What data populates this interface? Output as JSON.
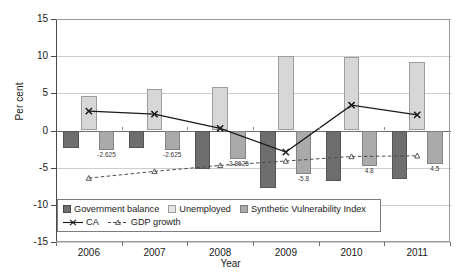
{
  "chart_data": {
    "type": "bar",
    "title": "",
    "xlabel": "Year",
    "ylabel": "Per cent",
    "categories": [
      "2006",
      "2007",
      "2008",
      "2009",
      "2010",
      "2011"
    ],
    "ylim": [
      -15,
      15
    ],
    "yticks": [
      15,
      10,
      5,
      0,
      -5,
      -10,
      -15
    ],
    "grid": true,
    "legend_position": "bottom-left-inside",
    "series": [
      {
        "name": "Government balance",
        "type": "bar",
        "color": "#6e6e6e",
        "values": [
          -2.3,
          -2.4,
          -5.2,
          -7.8,
          -6.8,
          -6.5
        ]
      },
      {
        "name": "Unemployed",
        "type": "bar",
        "color": "#d7d7d7",
        "values": [
          4.6,
          5.6,
          5.9,
          10.0,
          9.9,
          9.2
        ]
      },
      {
        "name": "Synthetic Vulnerability Index",
        "type": "bar",
        "color": "#aaaaaa",
        "values": [
          -2.625,
          -2.625,
          -3.8625,
          -5.8,
          -4.8,
          -4.5
        ],
        "data_labels": [
          "-2.625",
          "-2.625",
          "-3.8625",
          "-5.8",
          "4.8",
          "4.5"
        ]
      },
      {
        "name": "CA",
        "type": "line",
        "marker": "x",
        "style": "solid",
        "color": "#1a1a1a",
        "values": [
          2.6,
          2.2,
          0.3,
          -2.9,
          3.4,
          2.1
        ]
      },
      {
        "name": "GDP growth",
        "type": "line",
        "marker": "triangle",
        "style": "dashed",
        "color": "#4a4a4a",
        "values": [
          -6.4,
          -5.5,
          -4.7,
          -4.1,
          -3.5,
          -3.4
        ]
      }
    ]
  },
  "axes": {
    "y_title": "Per cent",
    "x_title": "Year",
    "y_tick_labels": [
      "15",
      "10",
      "5",
      "0",
      "-5",
      "-10",
      "-15"
    ],
    "x_tick_labels": [
      "2006",
      "2007",
      "2008",
      "2009",
      "2010",
      "2011"
    ]
  },
  "legend": {
    "row1": [
      {
        "label": "Government balance",
        "swatch": "legend-swatch-gov"
      },
      {
        "label": "Unemployed",
        "swatch": "legend-swatch-unemployed"
      },
      {
        "label": "Synthetic Vulnerability Index",
        "swatch": "legend-swatch-svi"
      }
    ],
    "row2": [
      {
        "label": "CA",
        "swatch": "legend-line-ca"
      },
      {
        "label": "GDP growth",
        "swatch": "legend-line-gdp"
      }
    ]
  }
}
